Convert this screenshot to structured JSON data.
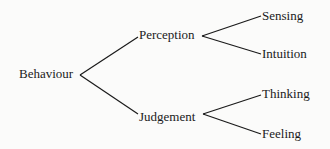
{
  "diagram": {
    "type": "tree",
    "root": {
      "label": "Behaviour"
    },
    "level1": [
      {
        "label": "Perception",
        "children": [
          {
            "label": "Sensing"
          },
          {
            "label": "Intuition"
          }
        ]
      },
      {
        "label": "Judgement",
        "children": [
          {
            "label": "Thinking"
          },
          {
            "label": "Feeling"
          }
        ]
      }
    ],
    "colors": {
      "line": "#1a1a1a",
      "text": "#1a1a1a",
      "background": "#fbfbfa"
    }
  }
}
